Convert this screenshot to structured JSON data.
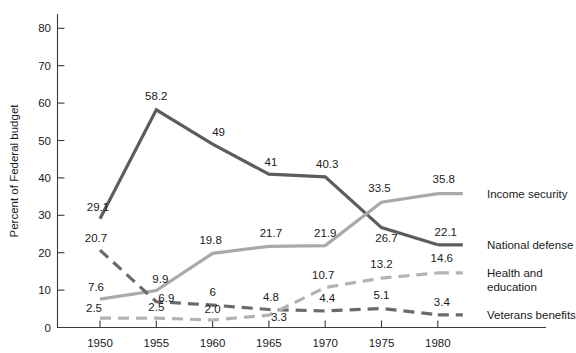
{
  "chart_data": {
    "type": "line",
    "title": "",
    "xlabel": "",
    "ylabel": "Percent of Federal budget",
    "categories": [
      "1950",
      "1955",
      "1960",
      "1965",
      "1970",
      "1975",
      "1980"
    ],
    "x": [
      1950,
      1955,
      1960,
      1965,
      1970,
      1975,
      1980
    ],
    "ylim": [
      0,
      85
    ],
    "xlim": [
      1948,
      1983
    ],
    "yticks": [
      0,
      10,
      20,
      30,
      40,
      50,
      60,
      70,
      80
    ],
    "ytick_labels": [
      "0",
      "10",
      "20",
      "30",
      "40",
      "50",
      "60",
      "70",
      "80"
    ],
    "xtick_labels": [
      "1950",
      "1955",
      "1960",
      "1965",
      "1970",
      "1975",
      "1980"
    ],
    "grid": false,
    "legend_position": "right-inline",
    "series": [
      {
        "name": "National defense",
        "color": "#5d5d5d",
        "style": "solid",
        "width": 3.2,
        "values": [
          29.1,
          58.2,
          49,
          41,
          40.3,
          26.7,
          22.1
        ],
        "labels": [
          "29.1",
          "58.2",
          "49",
          "41",
          "40.3",
          "26.7",
          "22.1"
        ]
      },
      {
        "name": "Income security",
        "color": "#a9a9a9",
        "style": "solid",
        "width": 3.2,
        "values": [
          7.6,
          9.9,
          19.8,
          21.7,
          21.9,
          33.5,
          35.8
        ],
        "labels": [
          "7.6",
          "9.9",
          "19.8",
          "21.7",
          "21.9",
          "33.5",
          "35.8"
        ]
      },
      {
        "name": "Veterans benefits",
        "color": "#6a6a6a",
        "style": "dashed",
        "width": 3.2,
        "values": [
          20.7,
          6.9,
          6,
          4.8,
          4.4,
          5.1,
          3.4
        ],
        "labels": [
          "20.7",
          "6.9",
          "6",
          "4.8",
          "4.4",
          "5.1",
          "3.4"
        ]
      },
      {
        "name": "Health and education",
        "color": "#b3b3b3",
        "style": "dashed",
        "width": 3.2,
        "values": [
          2.5,
          2.5,
          2.0,
          3.3,
          10.7,
          13.2,
          14.6
        ],
        "labels": [
          "2.5",
          "2.5",
          "2.0",
          "3.3",
          "10.7",
          "13.2",
          "14.6"
        ]
      }
    ],
    "legend_entries": [
      {
        "label": "Income security",
        "color": "#a9a9a9"
      },
      {
        "label": "National defense",
        "color": "#5d5d5d"
      },
      {
        "label": "Health and",
        "color": "#b3b3b3"
      },
      {
        "label": "education",
        "color": "#b3b3b3"
      },
      {
        "label": "Veterans benefits",
        "color": "#6a6a6a"
      }
    ]
  },
  "axis": {
    "y_title": "Percent of Federal budget"
  }
}
